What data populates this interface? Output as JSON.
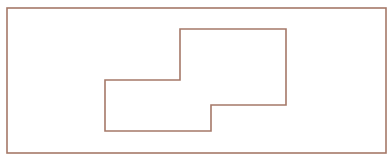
{
  "diagram": {
    "background": "#ffffff",
    "stroke_color": "#a57868",
    "stroke_width": 1.6,
    "outer_rect": {
      "x": 7,
      "y": 8,
      "width": 379,
      "height": 145
    },
    "inner_shape": {
      "points": "105,80 180,80 180,29 286,29 286,105 211,105 211,131 105,131"
    }
  }
}
